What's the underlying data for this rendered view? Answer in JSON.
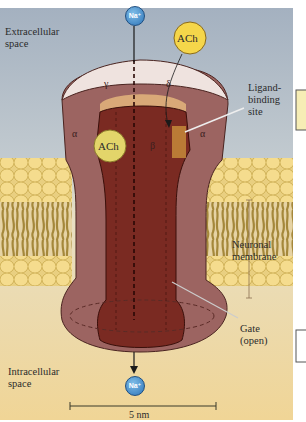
{
  "figure": {
    "regions": {
      "extracellular": {
        "label_line1": "Extracellular",
        "label_line2": "space",
        "color": "#a9b5c3"
      },
      "intracellular": {
        "label_line1": "Intracellular",
        "label_line2": "space",
        "color": "#f0d9a0"
      }
    },
    "channel": {
      "subunits": [
        {
          "symbol": "γ",
          "position": "back-left-top"
        },
        {
          "symbol": "δ",
          "position": "back-right-top"
        },
        {
          "symbol": "α",
          "position": "left"
        },
        {
          "symbol": "β",
          "position": "center"
        },
        {
          "symbol": "α",
          "position": "right"
        }
      ],
      "colors": {
        "outer_subunit": "#9c6461",
        "inner_subunit": "#7a2a22",
        "rim_top": "#efe3df",
        "rim_inner": "#d9a978",
        "binding_site": "#c58a3a",
        "pore_line": "#3a0f0a"
      }
    },
    "ions": {
      "top": {
        "symbol": "Na⁺",
        "color": "#3f8fd0"
      },
      "bottom": {
        "symbol": "Na⁺",
        "color": "#3f8fd0"
      }
    },
    "ligands": [
      {
        "symbol": "ACh",
        "state": "free",
        "color": "#f5d64a"
      },
      {
        "symbol": "ACh",
        "state": "bound",
        "color": "#e3d56a"
      }
    ],
    "callouts": {
      "ligand_binding_site": {
        "line1": "Ligand-",
        "line2": "binding",
        "line3": "site"
      },
      "neuronal_membrane": {
        "line1": "Neuronal",
        "line2": "membrane"
      },
      "gate": {
        "line1": "Gate",
        "line2": "(open)"
      }
    },
    "membrane": {
      "head_color": "#f3d98a",
      "tail_color": "#a88a3a",
      "core_color": "#ead6a8"
    },
    "scale_bar": {
      "label": "5 nm"
    }
  }
}
